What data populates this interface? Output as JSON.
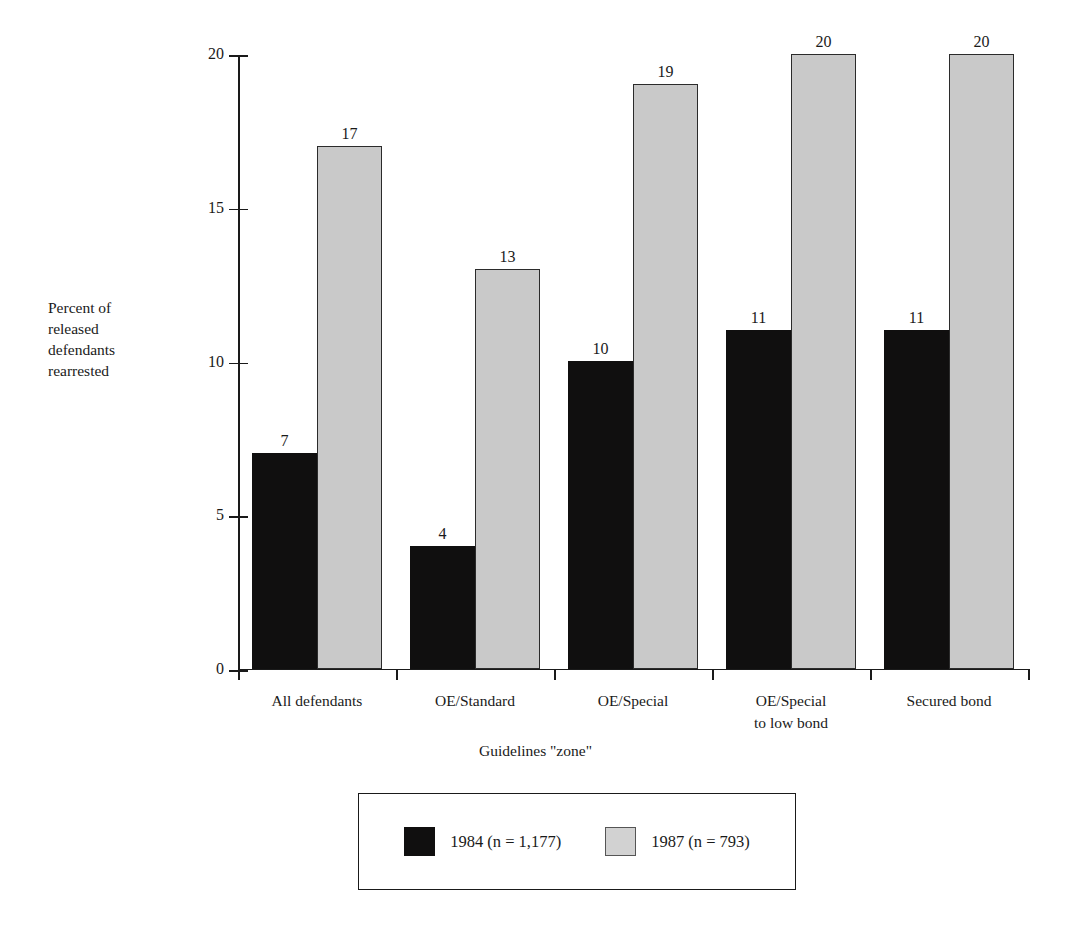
{
  "chart_data": {
    "type": "bar",
    "title": "",
    "subtitle": "",
    "xlabel": "Guidelines \"zone\"",
    "ylabel": "Percent of\nreleased\ndefendants\nrearrested",
    "categories": [
      "All defendants",
      "OE/Standard",
      "OE/Special",
      "OE/Special\nto low bond",
      "Secured bond"
    ],
    "series": [
      {
        "name": "1984 (n = 1,177)",
        "color": "#100f0f",
        "values": [
          7,
          4,
          10,
          11,
          11
        ]
      },
      {
        "name": "1987 (n = 793)",
        "color": "#c9c9c9",
        "values": [
          17,
          13,
          19,
          20,
          20
        ]
      }
    ],
    "ylim": [
      0,
      20
    ],
    "yticks": [
      0,
      5,
      10,
      15,
      20
    ],
    "ytick_labels": [
      "0",
      "5",
      "10",
      "15",
      "20"
    ],
    "grid": false,
    "legend_position": "bottom-center",
    "value_labels": true
  },
  "axis": {
    "y_title": "Percent of\nreleased\ndefendants\nrearrested",
    "x_title": "Guidelines \"zone\"",
    "y_tick_labels": [
      "20",
      "15",
      "10",
      "5",
      "0"
    ]
  },
  "legend": {
    "entries": [
      {
        "label": "1984 (n = 1,177)",
        "swatch": "black-square-swatch"
      },
      {
        "label": "1987 (n = 793)",
        "swatch": "gray-square-swatch"
      }
    ]
  },
  "colors": {
    "series_1984": "#100f0f",
    "series_1987": "#c9c9c9",
    "axis": "#1a1a1a",
    "background": "#ffffff"
  }
}
